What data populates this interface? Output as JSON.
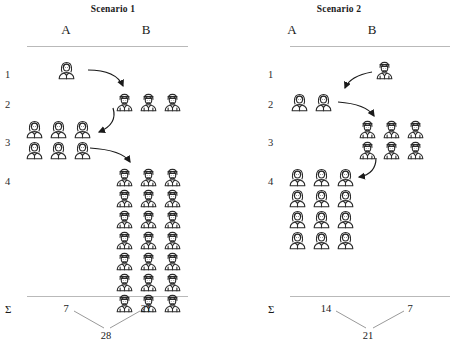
{
  "figure": {
    "row_labels": [
      "1",
      "2",
      "3",
      "4"
    ],
    "sum_symbol": "Σ"
  },
  "chart_data": {
    "type": "diagram",
    "panels": [
      {
        "title": "Scenario 1",
        "columns": [
          "A",
          "B"
        ],
        "rows": [
          {
            "label": "1",
            "column": "A",
            "count": 1,
            "icon": "female-person-icon",
            "grid_cols": 1
          },
          {
            "label": "2",
            "column": "B",
            "count": 3,
            "icon": "male-person-icon",
            "grid_cols": 3
          },
          {
            "label": "3",
            "column": "A",
            "count": 6,
            "icon": "female-person-icon",
            "grid_cols": 3
          },
          {
            "label": "4",
            "column": "B",
            "count": 21,
            "icon": "male-person-icon",
            "grid_cols": 3
          }
        ],
        "arrows": [
          {
            "from_row": "1",
            "from_column": "A",
            "to_row": "2",
            "to_column": "B"
          },
          {
            "from_row": "2",
            "from_column": "B",
            "to_row": "3",
            "to_column": "A"
          },
          {
            "from_row": "3",
            "from_column": "A",
            "to_row": "4",
            "to_column": "B"
          }
        ],
        "sums": {
          "A": "7",
          "B": "21",
          "total": "28"
        }
      },
      {
        "title": "Scenario 2",
        "columns": [
          "A",
          "B"
        ],
        "rows": [
          {
            "label": "1",
            "column": "B",
            "count": 1,
            "icon": "male-person-icon",
            "grid_cols": 1
          },
          {
            "label": "2",
            "column": "A",
            "count": 2,
            "icon": "female-person-icon",
            "grid_cols": 2
          },
          {
            "label": "3",
            "column": "B",
            "count": 6,
            "icon": "male-person-icon",
            "grid_cols": 3
          },
          {
            "label": "4",
            "column": "A",
            "count": 12,
            "icon": "female-person-icon",
            "grid_cols": 3
          }
        ],
        "arrows": [
          {
            "from_row": "1",
            "from_column": "B",
            "to_row": "2",
            "to_column": "A"
          },
          {
            "from_row": "2",
            "from_column": "A",
            "to_row": "3",
            "to_column": "B"
          },
          {
            "from_row": "3",
            "from_column": "B",
            "to_row": "4",
            "to_column": "A"
          }
        ],
        "sums": {
          "A": "14",
          "B": "7",
          "total": "21"
        }
      }
    ],
    "colors": {
      "icon_stroke": "#2b2b2b",
      "rule": "#b9b9b9",
      "arrow": "#1a1a1a",
      "text": "#1a1a1a"
    }
  }
}
